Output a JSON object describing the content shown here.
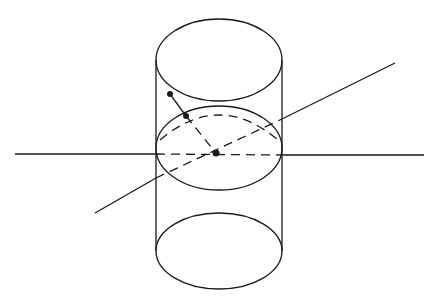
{
  "diagram": {
    "type": "geometric-figure",
    "colors": {
      "stroke": "#1a1a1a",
      "background": "#ffffff"
    },
    "cylinder": {
      "top_ellipse": {
        "cx": 219,
        "cy": 60,
        "rx": 63,
        "ry": 41
      },
      "bottom_ellipse": {
        "cx": 219,
        "cy": 251,
        "rx": 63,
        "ry": 38
      },
      "left_x": 156,
      "right_x": 282,
      "top_y": 60,
      "bottom_y": 251
    },
    "mid_ellipse": {
      "cx": 219,
      "cy": 148,
      "rx": 63,
      "ry": 42
    },
    "equator_dashed": {
      "cx": 219,
      "cy": 148,
      "rx": 63,
      "ry": 38
    },
    "horizontal_axis": {
      "left": [
        15,
        154
      ],
      "left_end": [
        156,
        154
      ],
      "right_start": [
        282,
        155
      ],
      "right": [
        424,
        155
      ]
    },
    "diagonal_axis": {
      "lower_left": [
        95,
        213
      ],
      "enter": [
        156,
        178
      ],
      "exit": [
        282,
        119
      ],
      "upper_right": [
        395,
        63
      ]
    },
    "points": {
      "outer": [
        170,
        94
      ],
      "surface": [
        186,
        116
      ],
      "center": [
        216,
        153
      ]
    }
  }
}
